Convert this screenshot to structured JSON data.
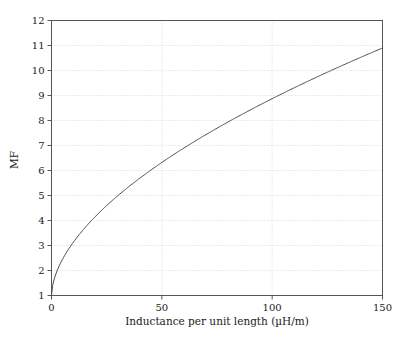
{
  "chart_data": {
    "type": "line",
    "title": "",
    "subtitle": "",
    "xlabel": "Inductance per unit length (µH/m)",
    "ylabel": "MF",
    "xlim": [
      0,
      150
    ],
    "ylim": [
      1,
      12
    ],
    "xticks": [
      0,
      50,
      100,
      150
    ],
    "xtick_labels": [
      "0",
      "50",
      "100",
      "150"
    ],
    "yticks": [
      1,
      2,
      3,
      4,
      5,
      6,
      7,
      8,
      9,
      10,
      11,
      12
    ],
    "ytick_labels": [
      "1",
      "2",
      "3",
      "4",
      "5",
      "6",
      "7",
      "8",
      "9",
      "10",
      "11",
      "12"
    ],
    "grid": true,
    "grid_style": "dotted",
    "grid_color": "#cfcfcf",
    "frame_color": "#555555",
    "legend": null,
    "legend_position": "none",
    "series": [
      {
        "name": "MF",
        "color": "#4d4d4d",
        "line_width": 1,
        "x": [
          0,
          1,
          2,
          3,
          4,
          5,
          7,
          10,
          13,
          16,
          20,
          25,
          30,
          35,
          40,
          45,
          50,
          55,
          60,
          65,
          70,
          75,
          80,
          85,
          90,
          95,
          100,
          105,
          110,
          115,
          120,
          125,
          130,
          135,
          140,
          145,
          150
        ],
        "values": [
          1.0,
          1.62,
          2.0,
          2.26,
          2.47,
          2.65,
          2.95,
          3.3,
          3.59,
          3.84,
          4.12,
          4.6,
          4.94,
          5.25,
          5.53,
          5.8,
          6.4,
          6.37,
          6.61,
          6.83,
          7.04,
          7.25,
          7.45,
          7.64,
          7.83,
          8.01,
          8.6,
          8.36,
          8.53,
          8.69,
          8.85,
          9.01,
          9.16,
          9.31,
          9.46,
          9.6,
          10.9
        ]
      }
    ]
  },
  "axes": {
    "x_tick_labels": [
      "0",
      "50",
      "100",
      "150"
    ],
    "y_tick_labels": [
      "1",
      "2",
      "3",
      "4",
      "5",
      "6",
      "7",
      "8",
      "9",
      "10",
      "11",
      "12"
    ],
    "x_axis_title": "Inductance per unit length (µH/m)",
    "y_axis_title": "MF"
  },
  "colors": {
    "curve": "#4d4d4d",
    "grid": "#cfcfcf",
    "frame": "#555555",
    "text": "#1a1a1a",
    "background": "#ffffff"
  }
}
